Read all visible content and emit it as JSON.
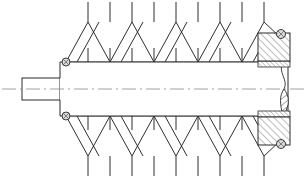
{
  "drawing": {
    "title": "Sectional assembly drawing — spring-loaded shaft with bearing blocks",
    "canvas": {
      "width": 308,
      "height": 178,
      "background": "#ffffff"
    },
    "line_color": "#2b2b2b",
    "centerline_color": "#8c8c8c",
    "hatch_color": "#4a4a4a"
  },
  "geometry": {
    "centerline": {
      "y": 89,
      "x_start": 2,
      "x_end": 306
    },
    "stub_shaft": {
      "x": 22,
      "y": 78,
      "width": 38,
      "height": 22
    },
    "main_body": {
      "left": 60,
      "right": 288,
      "top": 62,
      "bottom": 116,
      "shoulder_left": 60,
      "shoulder_top": 62,
      "shoulder_bottom": 116
    },
    "spring_top": {
      "baseline_y": 62,
      "apex_y": 22,
      "stub_top_y": 2,
      "stub_bottom_y": 78,
      "x_start": 66,
      "x_end": 262,
      "peaks": 8
    },
    "spring_bottom": {
      "baseline_y": 116,
      "apex_y": 156,
      "stub_bottom_y": 176,
      "stub_top_y": 100,
      "x_start": 66,
      "x_end": 262,
      "peaks": 8
    },
    "block_upper": {
      "x": 258,
      "y": 33,
      "width": 32,
      "height": 28
    },
    "block_lower": {
      "x": 258,
      "y": 117,
      "width": 32,
      "height": 28
    },
    "strip_upper": {
      "x": 258,
      "y": 61,
      "width": 32,
      "height": 6
    },
    "strip_lower": {
      "x": 258,
      "y": 111,
      "width": 32,
      "height": 6
    },
    "break_line": {
      "x": 283,
      "y_top": 62,
      "y_bottom": 116
    }
  },
  "components": [
    {
      "id": "stub-shaft",
      "label": "Stub shaft",
      "kind": "outline"
    },
    {
      "id": "main-body",
      "label": "Cylindrical body",
      "kind": "outline"
    },
    {
      "id": "spring-top",
      "label": "Upper zigzag spring",
      "kind": "spring",
      "peaks": 8
    },
    {
      "id": "spring-bottom",
      "label": "Lower zigzag spring",
      "kind": "spring",
      "peaks": 8
    },
    {
      "id": "bearing-block-upper",
      "label": "Upper sectioned bearing block",
      "kind": "section-hatch"
    },
    {
      "id": "bearing-block-lower",
      "label": "Lower sectioned bearing block",
      "kind": "section-hatch"
    },
    {
      "id": "seal-strip-upper",
      "label": "Upper seal strip",
      "kind": "section-hatch"
    },
    {
      "id": "seal-strip-lower",
      "label": "Lower seal strip",
      "kind": "section-hatch"
    },
    {
      "id": "detent-ball-top-left",
      "label": "Upper left detent pin",
      "kind": "circle"
    },
    {
      "id": "detent-ball-bottom-left",
      "label": "Lower left detent pin",
      "kind": "circle"
    },
    {
      "id": "detent-ball-top-right",
      "label": "Upper right detent ball",
      "kind": "circle"
    },
    {
      "id": "detent-ball-bottom-right",
      "label": "Lower right detent ball",
      "kind": "circle"
    },
    {
      "id": "centerline",
      "label": "Axis centerline",
      "kind": "centerline"
    },
    {
      "id": "break-line",
      "label": "Conventional break line",
      "kind": "break"
    }
  ],
  "detent_pins": [
    {
      "id": "pin-top-left",
      "cx": 66,
      "cy": 62,
      "r": 4
    },
    {
      "id": "pin-bottom-left",
      "cx": 66,
      "cy": 116,
      "r": 4
    },
    {
      "id": "ball-top-right",
      "cx": 281,
      "cy": 34,
      "r": 4.5
    },
    {
      "id": "ball-bottom-right",
      "cx": 281,
      "cy": 144,
      "r": 4.5
    }
  ]
}
